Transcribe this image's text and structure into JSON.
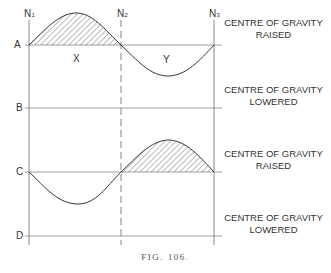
{
  "figure": {
    "caption": "FIG. 106.",
    "node_labels": [
      {
        "text": "N",
        "sub": "1"
      },
      {
        "text": "N",
        "sub": "2"
      },
      {
        "text": "N",
        "sub": "3"
      }
    ],
    "level_labels": [
      "A",
      "B",
      "C",
      "D"
    ],
    "region_labels": [
      "X",
      "Y"
    ],
    "side_labels": [
      {
        "line1": "CENTRE OF GRAVITY",
        "line2": "RAISED"
      },
      {
        "line1": "CENTRE OF GRAVITY",
        "line2": "LOWERED"
      },
      {
        "line1": "CENTRE OF GRAVITY",
        "line2": "RAISED"
      },
      {
        "line1": "CENTRE OF GRAVITY",
        "line2": "LOWERED"
      }
    ],
    "colors": {
      "line": "#333333",
      "guide": "#777777",
      "hatch": "#555555",
      "background": "#ffffff"
    }
  }
}
